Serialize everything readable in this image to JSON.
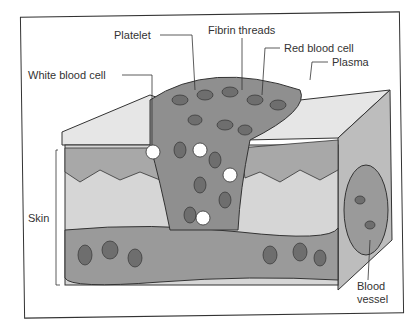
{
  "diagram": {
    "labels": {
      "fibrin": "Fibrin threads",
      "platelet": "Platelet",
      "rbc": "Red blood cell",
      "wbc": "White blood cell",
      "plasma": "Plasma",
      "skin": "Skin",
      "vessel_1": "Blood",
      "vessel_2": "vessel"
    },
    "colors": {
      "line": "#333333",
      "clot": "#8f8f8f",
      "cell": "#6e6e6e",
      "dermis": "#cfcfcf",
      "top": "#e6e6e6",
      "vessel": "#9a9a9a"
    }
  }
}
